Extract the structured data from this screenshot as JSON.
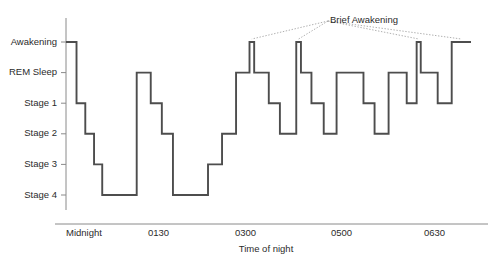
{
  "chart_data": {
    "type": "line",
    "subtype": "step-hypnogram",
    "title": "",
    "xlabel": "Time of night",
    "ylabel": "",
    "grid": false,
    "legend": null,
    "y_categories": [
      "Awakening",
      "REM Sleep",
      "Stage 1",
      "Stage 2",
      "Stage 3",
      "Stage 4"
    ],
    "y_levels": [
      0,
      1,
      2,
      3,
      4,
      5
    ],
    "x_ticks": [
      {
        "label": "Midnight",
        "value": 0
      },
      {
        "label": "0130",
        "value": 90
      },
      {
        "label": "0300",
        "value": 180
      },
      {
        "label": "0500",
        "value": 300
      },
      {
        "label": "0630",
        "value": 390
      }
    ],
    "xlim": [
      0,
      450
    ],
    "ylim": [
      0,
      5
    ],
    "annotations": [
      {
        "text": "Brief Awakening",
        "points": [
          "spike-1",
          "spike-2",
          "spike-3"
        ]
      }
    ],
    "series": [
      {
        "name": "Sleep stage",
        "color": "#4d4d4d",
        "steps": [
          {
            "start": 0,
            "end": 18,
            "stage": "Awakening"
          },
          {
            "start": 18,
            "end": 33,
            "stage": "Stage 1"
          },
          {
            "start": 33,
            "end": 48,
            "stage": "Stage 2"
          },
          {
            "start": 48,
            "end": 62,
            "stage": "Stage 3"
          },
          {
            "start": 62,
            "end": 121,
            "stage": "Stage 4"
          },
          {
            "start": 121,
            "end": 145,
            "stage": "REM Sleep"
          },
          {
            "start": 145,
            "end": 164,
            "stage": "Stage 1"
          },
          {
            "start": 164,
            "end": 183,
            "stage": "Stage 2"
          },
          {
            "start": 183,
            "end": 243,
            "stage": "Stage 4"
          },
          {
            "start": 243,
            "end": 267,
            "stage": "Stage 3"
          },
          {
            "start": 267,
            "end": 291,
            "stage": "Stage 2"
          },
          {
            "start": 291,
            "end": 314,
            "stage": "REM Sleep"
          },
          {
            "start": 314,
            "end": 322,
            "stage": "Awakening"
          },
          {
            "start": 322,
            "end": 347,
            "stage": "REM Sleep"
          },
          {
            "start": 347,
            "end": 366,
            "stage": "Stage 1"
          },
          {
            "start": 366,
            "end": 394,
            "stage": "Stage 2"
          },
          {
            "start": 394,
            "end": 402,
            "stage": "Awakening"
          },
          {
            "start": 402,
            "end": 420,
            "stage": "REM Sleep"
          },
          {
            "start": 420,
            "end": 441,
            "stage": "Stage 1"
          },
          {
            "start": 441,
            "end": 463,
            "stage": "Stage 2"
          },
          {
            "start": 463,
            "end": 509,
            "stage": "REM Sleep"
          },
          {
            "start": 509,
            "end": 528,
            "stage": "Stage 1"
          },
          {
            "start": 528,
            "end": 552,
            "stage": "Stage 2"
          },
          {
            "start": 552,
            "end": 583,
            "stage": "REM Sleep"
          },
          {
            "start": 583,
            "end": 600,
            "stage": "Stage 1"
          },
          {
            "start": 600,
            "end": 607,
            "stage": "Awakening"
          },
          {
            "start": 607,
            "end": 636,
            "stage": "REM Sleep"
          },
          {
            "start": 636,
            "end": 660,
            "stage": "Stage 1"
          },
          {
            "start": 660,
            "end": 693,
            "stage": "Awakening"
          }
        ]
      }
    ]
  },
  "figure": {
    "annotation_label": "Brief Awakening",
    "axis_title_x": "Time of night"
  }
}
